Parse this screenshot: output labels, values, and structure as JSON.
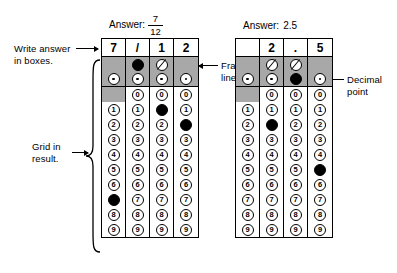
{
  "figure": {
    "labels": {
      "write_answer": "Write answer\nin boxes.",
      "grid_in_result": "Grid in\nresult.",
      "fraction_line": "Fraction\nline",
      "decimal_point": "Decimal\npoint"
    },
    "colors": {
      "shade": "#a8a8a8",
      "ink": "#000000",
      "paper": "#ffffff"
    },
    "grids": [
      {
        "id": "fraction-grid",
        "caption_prefix": "Answer:",
        "caption_kind": "fraction",
        "caption_numerator": "7",
        "caption_denominator": "12",
        "answer_boxes": [
          "7",
          "/",
          "1",
          "2"
        ],
        "fraction_row": [
          {
            "present": false,
            "marked": false
          },
          {
            "present": true,
            "marked": true
          },
          {
            "present": true,
            "marked": false
          },
          {
            "present": false,
            "marked": false
          }
        ],
        "decimal_row": [
          {
            "present": true,
            "marked": false
          },
          {
            "present": true,
            "marked": false
          },
          {
            "present": true,
            "marked": false
          },
          {
            "present": true,
            "marked": false
          }
        ],
        "digit_rows": [
          {
            "digit": "0",
            "cells": [
              {
                "present": false,
                "marked": false
              },
              {
                "present": true,
                "marked": false
              },
              {
                "present": true,
                "marked": false
              },
              {
                "present": true,
                "marked": false
              }
            ]
          },
          {
            "digit": "1",
            "cells": [
              {
                "present": true,
                "marked": false
              },
              {
                "present": true,
                "marked": false
              },
              {
                "present": true,
                "marked": true
              },
              {
                "present": true,
                "marked": false
              }
            ]
          },
          {
            "digit": "2",
            "cells": [
              {
                "present": true,
                "marked": false
              },
              {
                "present": true,
                "marked": false
              },
              {
                "present": true,
                "marked": false
              },
              {
                "present": true,
                "marked": true
              }
            ]
          },
          {
            "digit": "3",
            "cells": [
              {
                "present": true,
                "marked": false
              },
              {
                "present": true,
                "marked": false
              },
              {
                "present": true,
                "marked": false
              },
              {
                "present": true,
                "marked": false
              }
            ]
          },
          {
            "digit": "4",
            "cells": [
              {
                "present": true,
                "marked": false
              },
              {
                "present": true,
                "marked": false
              },
              {
                "present": true,
                "marked": false
              },
              {
                "present": true,
                "marked": false
              }
            ]
          },
          {
            "digit": "5",
            "cells": [
              {
                "present": true,
                "marked": false
              },
              {
                "present": true,
                "marked": false
              },
              {
                "present": true,
                "marked": false
              },
              {
                "present": true,
                "marked": false
              }
            ]
          },
          {
            "digit": "6",
            "cells": [
              {
                "present": true,
                "marked": false
              },
              {
                "present": true,
                "marked": false
              },
              {
                "present": true,
                "marked": false
              },
              {
                "present": true,
                "marked": false
              }
            ]
          },
          {
            "digit": "7",
            "cells": [
              {
                "present": true,
                "marked": true
              },
              {
                "present": true,
                "marked": false
              },
              {
                "present": true,
                "marked": false
              },
              {
                "present": true,
                "marked": false
              }
            ]
          },
          {
            "digit": "8",
            "cells": [
              {
                "present": true,
                "marked": false
              },
              {
                "present": true,
                "marked": false
              },
              {
                "present": true,
                "marked": false
              },
              {
                "present": true,
                "marked": false
              }
            ]
          },
          {
            "digit": "9",
            "cells": [
              {
                "present": true,
                "marked": false
              },
              {
                "present": true,
                "marked": false
              },
              {
                "present": true,
                "marked": false
              },
              {
                "present": true,
                "marked": false
              }
            ]
          }
        ]
      },
      {
        "id": "decimal-grid",
        "caption_prefix": "Answer:",
        "caption_kind": "plain",
        "caption_value": "2.5",
        "answer_boxes": [
          "",
          "2",
          ".",
          "5"
        ],
        "fraction_row": [
          {
            "present": false,
            "marked": false
          },
          {
            "present": true,
            "marked": false
          },
          {
            "present": true,
            "marked": false
          },
          {
            "present": false,
            "marked": false
          }
        ],
        "decimal_row": [
          {
            "present": true,
            "marked": false
          },
          {
            "present": true,
            "marked": false
          },
          {
            "present": true,
            "marked": true
          },
          {
            "present": true,
            "marked": false
          }
        ],
        "digit_rows": [
          {
            "digit": "0",
            "cells": [
              {
                "present": false,
                "marked": false
              },
              {
                "present": true,
                "marked": false
              },
              {
                "present": true,
                "marked": false
              },
              {
                "present": true,
                "marked": false
              }
            ]
          },
          {
            "digit": "1",
            "cells": [
              {
                "present": true,
                "marked": false
              },
              {
                "present": true,
                "marked": false
              },
              {
                "present": true,
                "marked": false
              },
              {
                "present": true,
                "marked": false
              }
            ]
          },
          {
            "digit": "2",
            "cells": [
              {
                "present": true,
                "marked": false
              },
              {
                "present": true,
                "marked": true
              },
              {
                "present": true,
                "marked": false
              },
              {
                "present": true,
                "marked": false
              }
            ]
          },
          {
            "digit": "3",
            "cells": [
              {
                "present": true,
                "marked": false
              },
              {
                "present": true,
                "marked": false
              },
              {
                "present": true,
                "marked": false
              },
              {
                "present": true,
                "marked": false
              }
            ]
          },
          {
            "digit": "4",
            "cells": [
              {
                "present": true,
                "marked": false
              },
              {
                "present": true,
                "marked": false
              },
              {
                "present": true,
                "marked": false
              },
              {
                "present": true,
                "marked": false
              }
            ]
          },
          {
            "digit": "5",
            "cells": [
              {
                "present": true,
                "marked": false
              },
              {
                "present": true,
                "marked": false
              },
              {
                "present": true,
                "marked": false
              },
              {
                "present": true,
                "marked": true
              }
            ]
          },
          {
            "digit": "6",
            "cells": [
              {
                "present": true,
                "marked": false
              },
              {
                "present": true,
                "marked": false
              },
              {
                "present": true,
                "marked": false
              },
              {
                "present": true,
                "marked": false
              }
            ]
          },
          {
            "digit": "7",
            "cells": [
              {
                "present": true,
                "marked": false
              },
              {
                "present": true,
                "marked": false
              },
              {
                "present": true,
                "marked": false
              },
              {
                "present": true,
                "marked": false
              }
            ]
          },
          {
            "digit": "8",
            "cells": [
              {
                "present": true,
                "marked": false
              },
              {
                "present": true,
                "marked": false
              },
              {
                "present": true,
                "marked": false
              },
              {
                "present": true,
                "marked": false
              }
            ]
          },
          {
            "digit": "9",
            "cells": [
              {
                "present": true,
                "marked": false
              },
              {
                "present": true,
                "marked": false
              },
              {
                "present": true,
                "marked": false
              },
              {
                "present": true,
                "marked": false
              }
            ]
          }
        ]
      }
    ]
  }
}
